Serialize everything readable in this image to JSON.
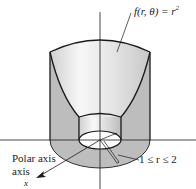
{
  "figure": {
    "function_label": "f(r, θ) = r",
    "function_exponent": "2",
    "range_label": "1 ≤ r ≤ 2",
    "polar_axis_label_line1": "Polar axis",
    "polar_axis_label_line2": "axis",
    "x_axis_label": "x"
  },
  "colors": {
    "line": "#1a1a1a",
    "surface_light": "#f2f2f2",
    "surface_mid": "#d8d8d8",
    "side_fill": "#bdbdbd",
    "background": "#ffffff"
  }
}
